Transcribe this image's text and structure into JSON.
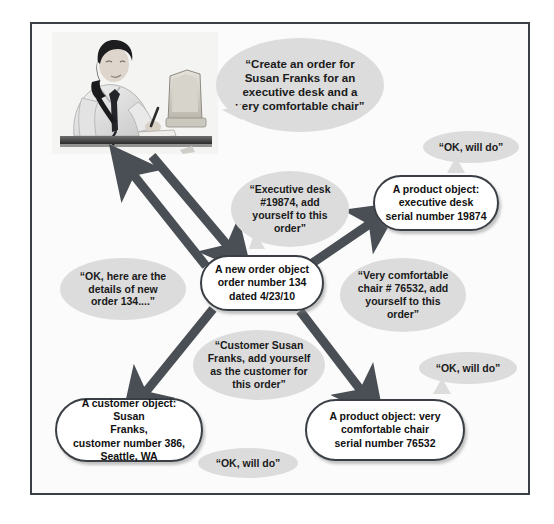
{
  "diagram": {
    "frame_border_color": "#3a3f45",
    "bubble_color": "#dcdcdc",
    "node_border_color": "#3a3f45",
    "arrow_color": "#4a4f55",
    "photo": {
      "alt": "Salesperson at desk talking on telephone while writing on a notepad next to a computer monitor",
      "icon": "person-on-phone-at-desk-photo"
    },
    "bubbles": [
      {
        "id": "request",
        "text": "“Create an order for\nSusan Franks for an\nexecutive desk and a\nvery comfortable chair”"
      },
      {
        "id": "ok-will-do-desk",
        "text": "“OK, will do”"
      },
      {
        "id": "executive-desk-message",
        "text": "“Executive desk\n#19874, add\nyourself to this\norder”"
      },
      {
        "id": "order-details-reply",
        "text": "“OK, here are the\ndetails of new\norder 134....”"
      },
      {
        "id": "comfortable-chair-message",
        "text": "“Very comfortable\nchair # 76532, add\nyourself to this\norder”"
      },
      {
        "id": "customer-message",
        "text": "“Customer Susan\nFranks, add yourself\nas the customer for\nthis order”"
      },
      {
        "id": "ok-will-do-chair",
        "text": "“OK, will do”"
      },
      {
        "id": "ok-will-do-customer",
        "text": "“OK, will do”"
      }
    ],
    "nodes": [
      {
        "id": "order-object",
        "text": "A new order object\norder number 134\ndated 4/23/10"
      },
      {
        "id": "desk-product-object",
        "text": "A product object:\nexecutive desk\nserial number 19874"
      },
      {
        "id": "customer-object",
        "text": "A customer object: Susan\nFranks,\ncustomer number 386,\nSeattle, WA"
      },
      {
        "id": "chair-product-object",
        "text": "A product object: very\ncomfortable chair\nserial number 76532"
      }
    ],
    "arrows": [
      {
        "id": "person-to-order-outbound",
        "from": "person",
        "to": "order-object"
      },
      {
        "id": "order-to-person-reply",
        "from": "order-object",
        "to": "person"
      },
      {
        "id": "order-to-desk",
        "from": "order-object",
        "to": "desk-product-object"
      },
      {
        "id": "order-to-customer",
        "from": "order-object",
        "to": "customer-object"
      },
      {
        "id": "order-to-chair",
        "from": "order-object",
        "to": "chair-product-object"
      }
    ]
  }
}
